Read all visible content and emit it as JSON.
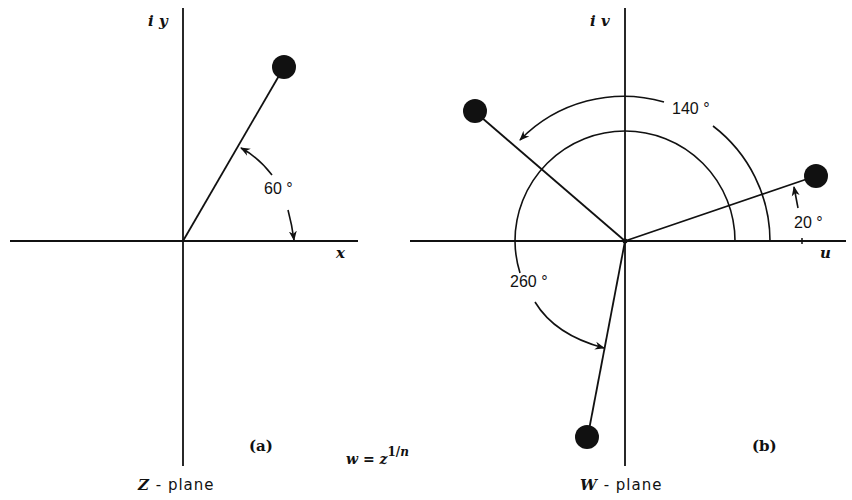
{
  "panel_a": {
    "vertical_axis_label": "i y",
    "horizontal_axis_label": "x",
    "angle_label": "60 °",
    "panel_label": "(a)",
    "plane_var": "Z",
    "plane_suffix": " - plane",
    "angle_deg": 60
  },
  "panel_b": {
    "vertical_axis_label": "i v",
    "horizontal_axis_label": "u",
    "angle_labels": [
      "140 °",
      "20 °",
      "260 °"
    ],
    "panel_label": "(b)",
    "plane_var": "W",
    "plane_suffix": " - plane",
    "roots_deg": [
      20,
      140,
      260
    ]
  },
  "formula": {
    "lhs": "w = z",
    "exponent_num": "1/",
    "exponent_var": "n"
  }
}
